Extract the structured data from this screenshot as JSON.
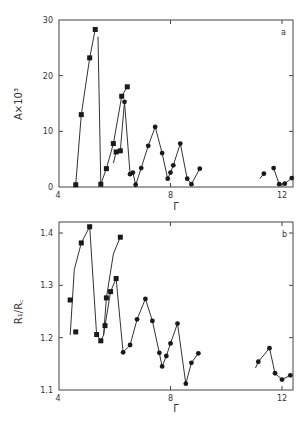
{
  "chart_data": [
    {
      "id": "a",
      "type": "line",
      "panel_label": "a",
      "xlabel": "Γ",
      "ylabel": "A×10³",
      "xlim": [
        4,
        12.4
      ],
      "ylim": [
        0,
        30
      ],
      "xticks": [
        4,
        8,
        12
      ],
      "xtick_labels": [
        "4",
        "8",
        "12"
      ],
      "yticks": [
        0,
        10,
        20,
        30
      ],
      "ytick_labels": [
        "0",
        "10",
        "20",
        "30"
      ],
      "grid": false,
      "series": [
        {
          "name": "branch-1",
          "marker": "square",
          "line": "curve",
          "x": [
            4.6,
            4.8,
            5.0,
            5.3
          ],
          "y": [
            0.4,
            13.0,
            23.2,
            28.3
          ]
        },
        {
          "name": "drop-1",
          "marker": "none",
          "line": "straight",
          "x": [
            5.3,
            5.5,
            5.3
          ],
          "y": [
            27.0,
            0.5,
            0.5
          ]
        },
        {
          "name": "branch-2",
          "marker": "square",
          "line": "curve",
          "x": [
            5.6,
            5.8,
            6.1,
            6.3
          ],
          "y": [
            0.5,
            3.3,
            8.0,
            16.3
          ]
        },
        {
          "name": "branch-2b",
          "marker": "square",
          "line": "curve",
          "x": [
            6.0,
            6.1,
            6.25,
            6.45
          ],
          "y": [
            4.5,
            6.3,
            6.5,
            18.0
          ]
        },
        {
          "name": "drop-2",
          "marker": "square",
          "line": "straight",
          "x": [
            6.35,
            6.55,
            6.6,
            6.7,
            6.8
          ],
          "y": [
            15.3,
            2.3,
            2.6,
            0.4,
            0.4
          ]
        },
        {
          "name": "series-c1",
          "marker": "circle",
          "line": "straight",
          "x": [
            6.7,
            6.9,
            7.1,
            7.3,
            7.55,
            7.8,
            7.95,
            8.05,
            8.15,
            8.35,
            8.55,
            8.75,
            8.95
          ],
          "y": [
            0.4,
            3.4,
            7.4,
            10.8,
            6.1,
            1.5,
            2.6,
            3.9,
            7.8,
            1.5,
            0.5,
            3.3,
            3.3
          ]
        },
        {
          "name": "series-c2",
          "marker": "circle",
          "line": "straight",
          "x": [
            11.2,
            11.3,
            11.55,
            11.8,
            11.95,
            12.1,
            12.35
          ],
          "y": [
            1.5,
            2.4,
            3.4,
            0.5,
            0.6,
            1.6,
            1.6
          ]
        }
      ],
      "points_square": [
        [
          4.6,
          0.4
        ],
        [
          4.8,
          13.0
        ],
        [
          5.1,
          23.2
        ],
        [
          5.3,
          28.3
        ],
        [
          5.5,
          0.5
        ],
        [
          5.7,
          3.3
        ],
        [
          5.95,
          7.8
        ],
        [
          6.05,
          6.3
        ],
        [
          6.2,
          6.5
        ],
        [
          6.25,
          16.3
        ],
        [
          6.45,
          18.0
        ]
      ],
      "points_circle": [
        [
          6.35,
          15.3
        ],
        [
          6.55,
          2.3
        ],
        [
          6.65,
          2.6
        ],
        [
          6.75,
          0.4
        ],
        [
          6.95,
          3.4
        ],
        [
          7.2,
          7.4
        ],
        [
          7.45,
          10.8
        ],
        [
          7.7,
          6.1
        ],
        [
          7.9,
          1.5
        ],
        [
          8.0,
          2.6
        ],
        [
          8.1,
          3.9
        ],
        [
          8.35,
          7.8
        ],
        [
          8.6,
          1.5
        ],
        [
          8.75,
          0.5
        ],
        [
          9.05,
          3.3
        ],
        [
          11.35,
          2.4
        ],
        [
          11.7,
          3.4
        ],
        [
          11.9,
          0.5
        ],
        [
          12.1,
          0.6
        ],
        [
          12.35,
          1.6
        ]
      ]
    },
    {
      "id": "b",
      "type": "line",
      "panel_label": "b",
      "xlabel": "Γ",
      "ylabel": "R₁/R꜀",
      "xlim": [
        4,
        12.4
      ],
      "ylim": [
        1.1,
        1.42
      ],
      "xticks": [
        4,
        8,
        12
      ],
      "xtick_labels": [
        "4",
        "8",
        "12"
      ],
      "yticks": [
        1.1,
        1.2,
        1.3,
        1.4
      ],
      "ytick_labels": [
        "1.1",
        "1.2",
        "1.3",
        "1.4"
      ],
      "grid": false,
      "points_square": [
        [
          4.4,
          1.272
        ],
        [
          4.6,
          1.211
        ],
        [
          4.8,
          1.381
        ],
        [
          5.1,
          1.412
        ],
        [
          5.35,
          1.206
        ],
        [
          5.5,
          1.194
        ],
        [
          5.65,
          1.223
        ],
        [
          5.7,
          1.276
        ],
        [
          5.85,
          1.288
        ],
        [
          6.05,
          1.313
        ],
        [
          6.2,
          1.392
        ]
      ],
      "points_circle": [
        [
          6.3,
          1.172
        ],
        [
          6.55,
          1.186
        ],
        [
          6.8,
          1.235
        ],
        [
          7.1,
          1.274
        ],
        [
          7.35,
          1.232
        ],
        [
          7.6,
          1.171
        ],
        [
          7.7,
          1.145
        ],
        [
          7.85,
          1.165
        ],
        [
          8.0,
          1.189
        ],
        [
          8.25,
          1.227
        ],
        [
          8.55,
          1.112
        ],
        [
          8.75,
          1.152
        ],
        [
          9.0,
          1.17
        ],
        [
          11.15,
          1.154
        ],
        [
          11.55,
          1.18
        ],
        [
          11.75,
          1.132
        ],
        [
          12.0,
          1.12
        ],
        [
          12.3,
          1.128
        ]
      ]
    }
  ],
  "panels": {
    "a": {
      "label": "a",
      "ylabel": "A×10³",
      "xlabel": "Γ"
    },
    "b": {
      "label": "b",
      "ylabel": "R₁/R꜀",
      "xlabel": "Γ"
    }
  }
}
